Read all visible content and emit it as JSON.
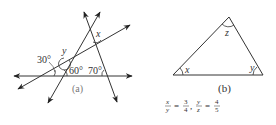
{
  "figure_a": {
    "caption": "(a)",
    "angle_labels": {
      "a30": "30°",
      "a60": "60°",
      "a70": "70°",
      "y": "y",
      "x": "x"
    }
  },
  "figure_b": {
    "caption": "(b)",
    "vertex_labels": {
      "x": "x",
      "y": "y",
      "z": "z"
    },
    "condition": {
      "f1_num": "x",
      "f1_den": "y",
      "f1_val_num": "3",
      "f1_val_den": "4",
      "f2_num": "y",
      "f2_den": "z",
      "f2_val_num": "4",
      "f2_val_den": "5",
      "equals": "=",
      "sep": ","
    }
  },
  "colors": {
    "line": "#333333",
    "caption": "#777777"
  }
}
